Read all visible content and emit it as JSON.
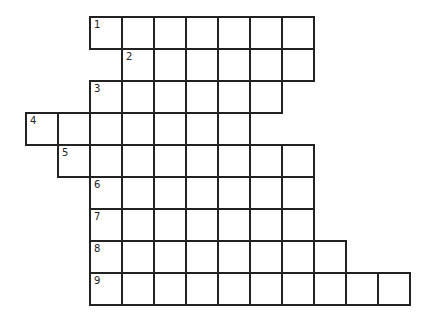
{
  "puzzle": {
    "type": "crossword-grid",
    "cell_size_px": 32,
    "origin": {
      "x": 26,
      "y": 17
    },
    "line_color": "#222222",
    "rows": [
      {
        "number": "1",
        "start_col": 2,
        "length": 7
      },
      {
        "number": "2",
        "start_col": 3,
        "length": 6
      },
      {
        "number": "3",
        "start_col": 2,
        "length": 6
      },
      {
        "number": "4",
        "start_col": 0,
        "length": 7
      },
      {
        "number": "5",
        "start_col": 1,
        "length": 8
      },
      {
        "number": "6",
        "start_col": 2,
        "length": 7
      },
      {
        "number": "7",
        "start_col": 2,
        "length": 7
      },
      {
        "number": "8",
        "start_col": 2,
        "length": 8
      },
      {
        "number": "9",
        "start_col": 2,
        "length": 10
      }
    ]
  }
}
